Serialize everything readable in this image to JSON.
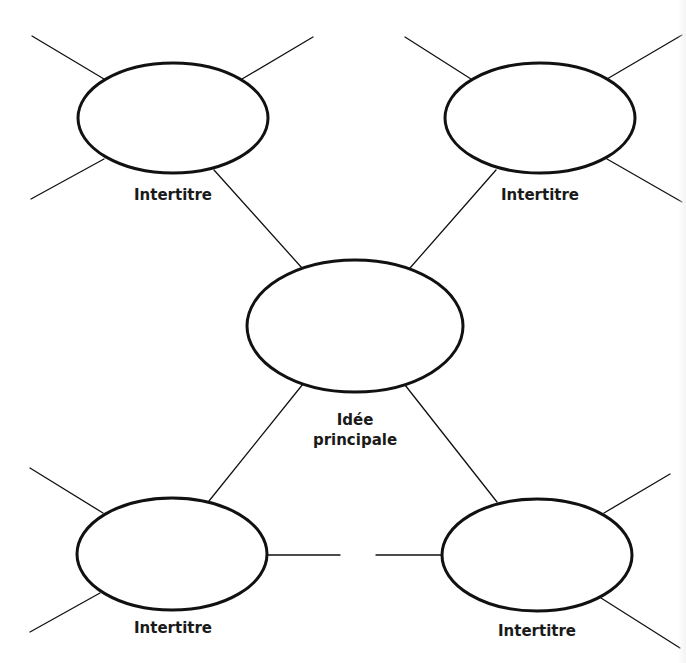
{
  "diagram": {
    "type": "mind-map / concept web",
    "colors": {
      "stroke": "#111111",
      "background": "#ffffff",
      "text": "#1a1a1a"
    },
    "center": {
      "label_line1": "Idée",
      "label_line2": "principale"
    },
    "nodes": [
      {
        "position": "top-left",
        "label": "Intertitre"
      },
      {
        "position": "top-right",
        "label": "Intertitre"
      },
      {
        "position": "bottom-left",
        "label": "Intertitre"
      },
      {
        "position": "bottom-right",
        "label": "Intertitre"
      }
    ]
  }
}
